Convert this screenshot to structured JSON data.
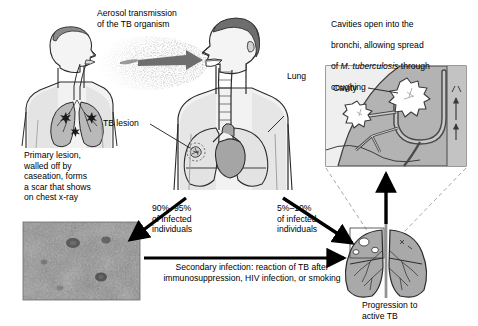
{
  "figure": {
    "title_text_blocks": {
      "aerosol": "Aerosol transmission\nof the TB organism",
      "cavities_line1": "Cavities open into the",
      "cavities_line2": "bronchi, allowing spread",
      "cavities_line3_pre": "of ",
      "cavities_line3_italic": "M. tuberculosis",
      "cavities_line3_post": " through",
      "cavities_line4": "coughing",
      "primary_lesion": "Primary lesion,\nwalled off by\ncaseation, forms\na scar that shows\non chest x-ray",
      "secondary_infection": "Secondary infection: reaction of TB after\nimmunosuppression, HIV infection, or smoking"
    },
    "labels": {
      "lung": "Lung",
      "tb_lesion": "TB lesion",
      "cavity": "Cavity",
      "progression": "Progression to\nactive TB",
      "pct_high": "90%–95%\nof infected\nindividuals",
      "pct_low": "5%–10%\nof infected\nindividuals"
    },
    "colors": {
      "ink": "#1a1a1a",
      "lung_fill": "#b4b4b4",
      "body_fill": "#f0f0f0",
      "hair_fill": "#6e6e6e",
      "inset_bg": "#b0b0b0",
      "inset_light": "#efefef",
      "cavity_fill": "#ffffff",
      "arrow_black": "#000000",
      "aerosol_gray": "#6b6b6b",
      "dashed_gray": "#a8a8a8",
      "xray_base": "#8d8d8d"
    }
  }
}
